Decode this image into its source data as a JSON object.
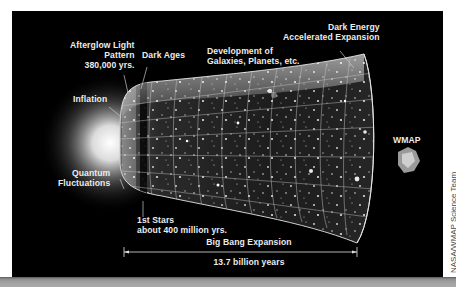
{
  "diagram": {
    "title": "Big Bang Expansion",
    "duration": "13.7 billion years",
    "credit": "NASA/WMAP Science Team",
    "labels": {
      "afterglow": [
        "Afterglow Light",
        "Pattern",
        "380,000 yrs."
      ],
      "dark_ages": "Dark Ages",
      "development": [
        "Development of",
        "Galaxies, Planets, etc."
      ],
      "dark_energy": [
        "Dark Energy",
        "Accelerated Expansion"
      ],
      "inflation": "Inflation",
      "quantum": [
        "Quantum",
        "Fluctuations"
      ],
      "first_stars": [
        "1st Stars",
        "about 400 million yrs."
      ],
      "wmap": "WMAP"
    },
    "colors": {
      "background": "#000000",
      "text": "#ececec",
      "grid": "#d0d0d0",
      "bottom_bar": "#a3a3a3"
    }
  }
}
